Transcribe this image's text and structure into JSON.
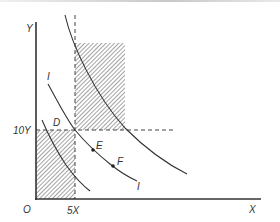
{
  "diagram": {
    "type": "indifference-curves-budget",
    "axes": {
      "y_label": "Y",
      "x_label": "X",
      "origin_label": "O",
      "y_tick_label": "10Y",
      "x_tick_label": "5X"
    },
    "points": [
      {
        "label": "D",
        "description": "intersection of 10Y and 5X guides on middle curve"
      },
      {
        "label": "E",
        "description": "point on middle curve"
      },
      {
        "label": "F",
        "description": "point on middle curve"
      }
    ],
    "curve_labels": {
      "upper_left": "I",
      "lower_right": "I"
    },
    "shaded_regions": [
      {
        "name": "upper-right-rectangle",
        "pattern": "diagonal-hatch"
      },
      {
        "name": "lower-left-rectangle",
        "pattern": "diagonal-hatch"
      }
    ],
    "colors": {
      "line": "#333333",
      "hatch": "#555555",
      "dashed": "#444444",
      "background": "#ffffff"
    }
  }
}
